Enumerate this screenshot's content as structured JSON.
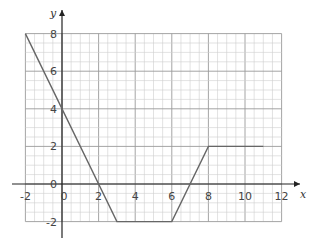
{
  "chart_data": {
    "type": "line",
    "title": "",
    "xlabel": "x",
    "ylabel": "y",
    "xlim": [
      -2,
      12
    ],
    "ylim": [
      -2,
      8
    ],
    "grid": true,
    "grid_minor_step": 0.5,
    "grid_major_step": 2,
    "x_ticks": [
      -2,
      0,
      2,
      4,
      6,
      8,
      10,
      12
    ],
    "y_ticks": [
      -2,
      0,
      2,
      4,
      6,
      8
    ],
    "x_tick_labels": [
      "-2",
      "0",
      "2",
      "4",
      "6",
      "8",
      "10",
      "12"
    ],
    "y_tick_labels": [
      "-2",
      "0",
      "2",
      "4",
      "6",
      "8"
    ],
    "series": [
      {
        "name": "graph",
        "x": [
          -2,
          3,
          6,
          8,
          11
        ],
        "y": [
          8,
          -2,
          -2,
          2,
          2
        ]
      }
    ],
    "colors": {
      "line": "#666666",
      "grid_minor": "#cfcfcf",
      "grid_major": "#9a9a9a",
      "axis": "#222222"
    }
  }
}
